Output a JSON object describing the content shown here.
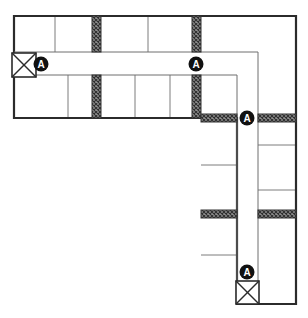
{
  "diagram": {
    "type": "architectural-floor-plan",
    "canvas": {
      "width": 308,
      "height": 318
    },
    "colors": {
      "background": "#ffffff",
      "outline": "#2b2b2b",
      "partition": "#6e6e6e",
      "hatch_fill": "#8a8a8a",
      "hatch_line": "#333333",
      "marker_fill": "#111111",
      "marker_text": "#ffffff"
    },
    "stroke_widths": {
      "outline": 2.2,
      "partition": 0.9,
      "corridor": 1.0,
      "hatch_border": 1.0
    }
  },
  "outline": {
    "name": "building-outline",
    "points": "14,16 296,16 296,304 237,304 237,118 14,118",
    "description": "L-shaped exterior wall outline"
  },
  "corridor": {
    "name": "corridor-path",
    "description": "Circulation corridor running east then south",
    "horizontal": {
      "x1": 14,
      "y1": 52,
      "x2": 258,
      "y2": 75
    },
    "vertical": {
      "x1": 237,
      "y1": 75,
      "x2": 258,
      "y2": 304
    },
    "outline_path": "M14,52 L258,52 L258,304 M14,75 L237,75 L237,304"
  },
  "rooms": {
    "upper_band_dividers_x": [
      55,
      148
    ],
    "lower_band_dividers_x": [
      68,
      135,
      170
    ],
    "right_column_dividers_y": [
      145,
      190
    ],
    "left_column_dividers_y": [
      165,
      255
    ],
    "bands": {
      "upper_y1": 16,
      "upper_y2": 52,
      "lower_y1": 75,
      "lower_y2": 118
    }
  },
  "hatched_joints": [
    {
      "name": "joint-vertical-1",
      "orientation": "vertical",
      "x": 92,
      "y": 16,
      "w": 9,
      "h": 36
    },
    {
      "name": "joint-vertical-2",
      "orientation": "vertical",
      "x": 92,
      "y": 75,
      "w": 9,
      "h": 43
    },
    {
      "name": "joint-vertical-3",
      "orientation": "vertical",
      "x": 192,
      "y": 16,
      "w": 9,
      "h": 36
    },
    {
      "name": "joint-vertical-4",
      "orientation": "vertical",
      "x": 192,
      "y": 75,
      "w": 9,
      "h": 43
    },
    {
      "name": "joint-horizontal-1",
      "orientation": "horizontal",
      "x": 201,
      "y": 114,
      "w": 36,
      "h": 8
    },
    {
      "name": "joint-horizontal-2",
      "orientation": "horizontal",
      "x": 258,
      "y": 114,
      "w": 38,
      "h": 8
    },
    {
      "name": "joint-horizontal-3",
      "orientation": "horizontal",
      "x": 201,
      "y": 210,
      "w": 36,
      "h": 8
    },
    {
      "name": "joint-horizontal-4",
      "orientation": "horizontal",
      "x": 258,
      "y": 210,
      "w": 38,
      "h": 8
    }
  ],
  "section_markers": [
    {
      "name": "section-marker-a-1",
      "label": "A",
      "cx": 41,
      "cy": 64,
      "r": 7.5
    },
    {
      "name": "section-marker-a-2",
      "label": "A",
      "cx": 196,
      "cy": 64,
      "r": 7.5
    },
    {
      "name": "section-marker-a-3",
      "label": "A",
      "cx": 247,
      "cy": 118,
      "r": 7.5
    },
    {
      "name": "section-marker-a-4",
      "label": "A",
      "cx": 247,
      "cy": 272,
      "r": 7.5
    }
  ],
  "shaft_symbols": [
    {
      "name": "shaft-symbol-top-left",
      "x": 12,
      "y": 53,
      "w": 24,
      "h": 24
    },
    {
      "name": "shaft-symbol-bottom-right",
      "x": 236,
      "y": 281,
      "w": 23,
      "h": 23
    }
  ],
  "legend": {
    "shaft_label": "X-boxed shaft",
    "marker_label": "A",
    "joint_label": "expansion joint"
  }
}
